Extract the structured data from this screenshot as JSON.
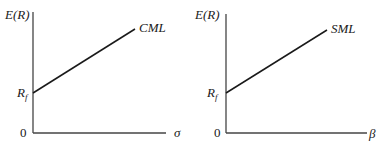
{
  "panels": [
    {
      "id": "cml",
      "y_axis_label": "E(R)",
      "x_axis_label": "σ",
      "intercept_label": "R",
      "intercept_sub": "f",
      "origin_label": "0",
      "line_label": "CML"
    },
    {
      "id": "sml",
      "y_axis_label": "E(R)",
      "x_axis_label": "β",
      "intercept_label": "R",
      "intercept_sub": "f",
      "origin_label": "0",
      "line_label": "SML"
    }
  ],
  "colors": {
    "line": "#1a1a1a",
    "axis": "#444444",
    "background": "#ffffff"
  }
}
